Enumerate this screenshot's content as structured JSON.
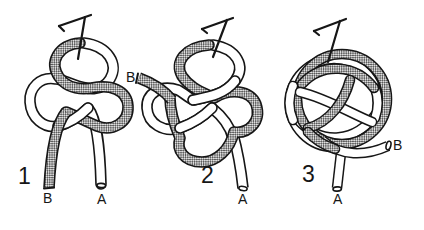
{
  "figures": [
    {
      "number": "1",
      "end_b": "B",
      "end_a": "A"
    },
    {
      "number": "2",
      "end_b": "B",
      "end_a": "A"
    },
    {
      "number": "3",
      "end_b": "B",
      "end_a": "A"
    }
  ],
  "icons": {
    "pin": "bent-t-pin"
  },
  "colors": {
    "ink_outline": "#161616",
    "rope_white": "#ffffff",
    "rope_stipple_dot": "#2f2f2f",
    "rope_stipple_bg": "#dedede",
    "background": "#ffffff"
  }
}
